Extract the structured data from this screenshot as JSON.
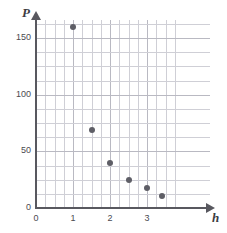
{
  "chart_data": {
    "type": "scatter",
    "title": "",
    "xlabel": "h",
    "ylabel": "P",
    "xlim": [
      0,
      3.75
    ],
    "ylim": [
      0,
      162.5
    ],
    "grid": true,
    "legend": "none",
    "x_ticks": [
      "0",
      "1",
      "2",
      "3"
    ],
    "x_tick_values": [
      0,
      1,
      2,
      3
    ],
    "y_ticks": [
      "0",
      "50",
      "100",
      "150"
    ],
    "y_tick_values": [
      0,
      50,
      100,
      150
    ],
    "x_minor_step": 0.25,
    "y_minor_step": 12.5,
    "point_color": "#5e5e66",
    "axis_color": "#58585f",
    "grid_color": "#cfcfd6",
    "points": [
      {
        "h": 1.0,
        "P": 160
      },
      {
        "h": 1.5,
        "P": 69
      },
      {
        "h": 2.0,
        "P": 40
      },
      {
        "h": 2.5,
        "P": 25
      },
      {
        "h": 3.0,
        "P": 18
      },
      {
        "h": 3.4,
        "P": 11
      }
    ]
  }
}
